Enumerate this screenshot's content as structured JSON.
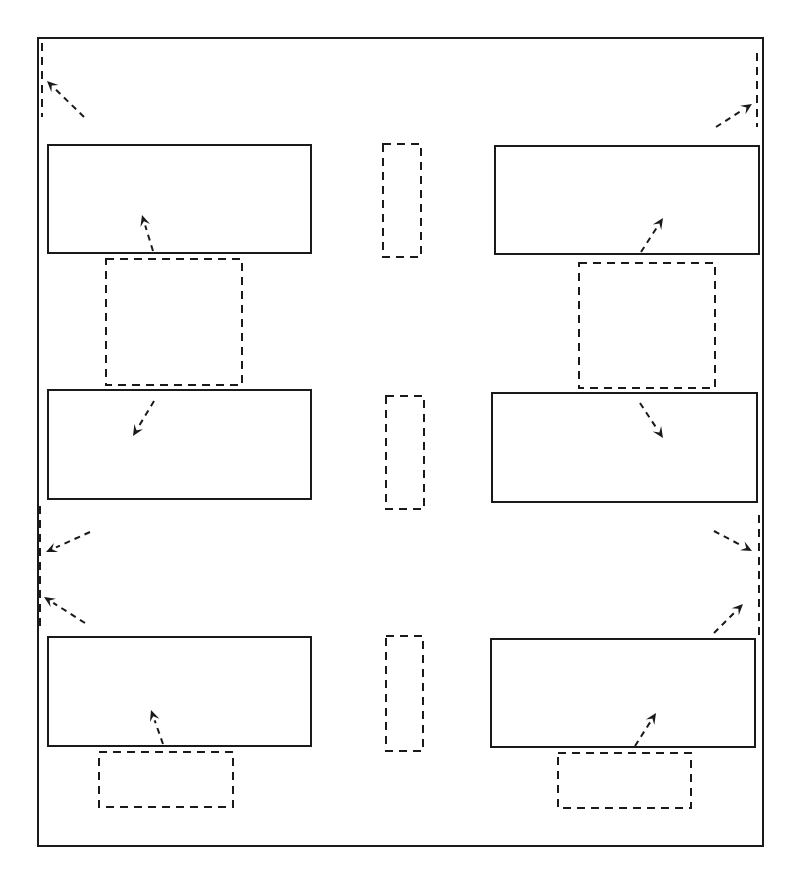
{
  "diagram": {
    "width": 797,
    "height": 875,
    "stroke_color": "#1a1a1a",
    "background": "#ffffff",
    "frame": {
      "x": 38,
      "y": 38,
      "w": 725,
      "h": 808
    },
    "solid_boxes": [
      {
        "name": "box-left-top",
        "x": 48,
        "y": 145,
        "w": 263,
        "h": 108
      },
      {
        "name": "box-right-top",
        "x": 495,
        "y": 146,
        "w": 264,
        "h": 108
      },
      {
        "name": "box-left-middle",
        "x": 48,
        "y": 390,
        "w": 263,
        "h": 109
      },
      {
        "name": "box-right-middle",
        "x": 492,
        "y": 393,
        "w": 265,
        "h": 109
      },
      {
        "name": "box-left-bottom",
        "x": 48,
        "y": 637,
        "w": 263,
        "h": 109
      },
      {
        "name": "box-right-bottom",
        "x": 491,
        "y": 639,
        "w": 264,
        "h": 108
      }
    ],
    "dashed_boxes": [
      {
        "name": "dashed-center-top",
        "x": 383,
        "y": 144,
        "w": 38,
        "h": 113
      },
      {
        "name": "dashed-center-middle",
        "x": 386,
        "y": 396,
        "w": 38,
        "h": 113
      },
      {
        "name": "dashed-center-bottom",
        "x": 386,
        "y": 636,
        "w": 37,
        "h": 115
      },
      {
        "name": "dashed-left-upper",
        "x": 106,
        "y": 259,
        "w": 136,
        "h": 126
      },
      {
        "name": "dashed-right-upper",
        "x": 579,
        "y": 263,
        "w": 136,
        "h": 125
      },
      {
        "name": "dashed-left-lower",
        "x": 99,
        "y": 752,
        "w": 134,
        "h": 55
      },
      {
        "name": "dashed-right-lower",
        "x": 558,
        "y": 753,
        "w": 133,
        "h": 55
      }
    ],
    "dashed_lines": [
      {
        "name": "dashed-edge-left-top",
        "x1": 42,
        "y1": 43,
        "x2": 42,
        "y2": 117
      },
      {
        "name": "dashed-edge-right-top",
        "x1": 757,
        "y1": 53,
        "x2": 757,
        "y2": 127
      },
      {
        "name": "dashed-edge-left-middle",
        "x1": 40,
        "y1": 506,
        "x2": 40,
        "y2": 627
      },
      {
        "name": "dashed-edge-right-middle",
        "x1": 759,
        "y1": 515,
        "x2": 759,
        "y2": 636
      }
    ],
    "arrows": [
      {
        "name": "arrow-to-left-top-edge",
        "x1": 84,
        "y1": 117,
        "x2": 47,
        "y2": 81
      },
      {
        "name": "arrow-to-right-top-edge",
        "x1": 716,
        "y1": 127,
        "x2": 752,
        "y2": 104
      },
      {
        "name": "arrow-into-left-top-box",
        "x1": 153,
        "y1": 251,
        "x2": 142,
        "y2": 215
      },
      {
        "name": "arrow-into-right-top-box",
        "x1": 641,
        "y1": 252,
        "x2": 663,
        "y2": 218
      },
      {
        "name": "arrow-into-left-middle-box",
        "x1": 154,
        "y1": 401,
        "x2": 133,
        "y2": 436
      },
      {
        "name": "arrow-into-right-middle-box",
        "x1": 640,
        "y1": 403,
        "x2": 663,
        "y2": 438
      },
      {
        "name": "arrow-to-left-middle-edge-a",
        "x1": 90,
        "y1": 532,
        "x2": 46,
        "y2": 552
      },
      {
        "name": "arrow-to-left-middle-edge-b",
        "x1": 85,
        "y1": 623,
        "x2": 44,
        "y2": 597
      },
      {
        "name": "arrow-to-right-middle-edge-a",
        "x1": 714,
        "y1": 531,
        "x2": 752,
        "y2": 551
      },
      {
        "name": "arrow-to-right-middle-edge-b",
        "x1": 714,
        "y1": 633,
        "x2": 743,
        "y2": 604
      },
      {
        "name": "arrow-into-left-bottom-box",
        "x1": 163,
        "y1": 744,
        "x2": 151,
        "y2": 710
      },
      {
        "name": "arrow-into-right-bottom-box",
        "x1": 635,
        "y1": 746,
        "x2": 656,
        "y2": 713
      }
    ]
  }
}
